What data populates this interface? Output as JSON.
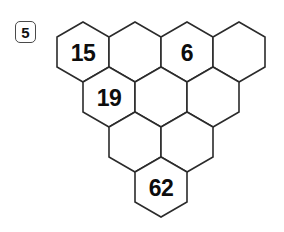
{
  "page": {
    "background_color": "#ffffff",
    "ink_color": "#2b2b2b"
  },
  "question_badge": {
    "number": "5",
    "border_color": "#4a4a4a",
    "text_color": "#111111"
  },
  "puzzle": {
    "type": "hexagon-triangle-grid",
    "rows": [
      4,
      3,
      2,
      1
    ],
    "total_cells": 10,
    "filled_count": 4,
    "empty_count": 6,
    "cells": [
      {
        "row": 0,
        "col": 0,
        "value": "15"
      },
      {
        "row": 0,
        "col": 1,
        "value": ""
      },
      {
        "row": 0,
        "col": 2,
        "value": "6"
      },
      {
        "row": 0,
        "col": 3,
        "value": ""
      },
      {
        "row": 1,
        "col": 0,
        "value": "19"
      },
      {
        "row": 1,
        "col": 1,
        "value": ""
      },
      {
        "row": 1,
        "col": 2,
        "value": ""
      },
      {
        "row": 2,
        "col": 0,
        "value": ""
      },
      {
        "row": 2,
        "col": 1,
        "value": ""
      },
      {
        "row": 3,
        "col": 0,
        "value": "62"
      }
    ],
    "geometry": {
      "origin_x": 57,
      "origin_y": 22,
      "hex_width": 52,
      "hex_height": 60,
      "row_pitch_y": 45,
      "row_offset_x": 26
    }
  }
}
